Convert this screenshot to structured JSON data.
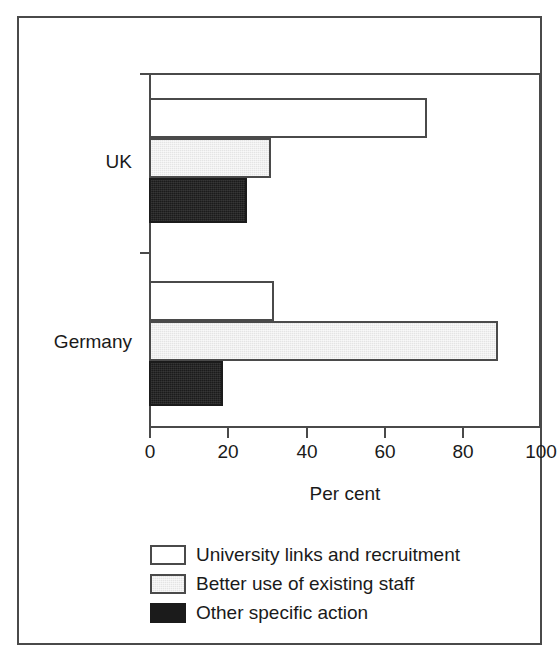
{
  "chart_data": {
    "type": "bar",
    "orientation": "horizontal",
    "title": "",
    "xlabel": "Per cent",
    "ylabel": "",
    "categories": [
      "UK",
      "Germany"
    ],
    "series": [
      {
        "name": "University links and recruitment",
        "values": [
          71,
          32
        ],
        "color": "#ffffff"
      },
      {
        "name": "Better use of existing staff",
        "values": [
          31,
          89
        ],
        "color": "#e4e4e4"
      },
      {
        "name": "Other specific action",
        "values": [
          25,
          19
        ],
        "color": "#1b1b1b"
      }
    ],
    "xlim": [
      0,
      100
    ],
    "xticks": [
      0,
      20,
      40,
      60,
      80,
      100
    ],
    "xtick_labels": [
      "0",
      "20",
      "40",
      "60",
      "80",
      "100"
    ],
    "grid": false,
    "legend_position": "below-axis-left"
  },
  "axis": {
    "x_title": "Per cent",
    "tick_labels": [
      "0",
      "20",
      "40",
      "60",
      "80",
      "100"
    ],
    "category_labels": [
      "UK",
      "Germany"
    ]
  },
  "legend": {
    "items": [
      {
        "label": "University links and recruitment",
        "swatch": "white-outlined-swatch"
      },
      {
        "label": "Better use of existing staff",
        "swatch": "grey-filled-swatch"
      },
      {
        "label": "Other specific action",
        "swatch": "black-filled-swatch"
      }
    ]
  },
  "colors": {
    "frame": "#4a4a4a",
    "axis": "#4a4a4a",
    "text": "#1a1a1a",
    "series_white": "#ffffff",
    "series_grey": "#e4e4e4",
    "series_black": "#1b1b1b",
    "background": "#ffffff"
  }
}
